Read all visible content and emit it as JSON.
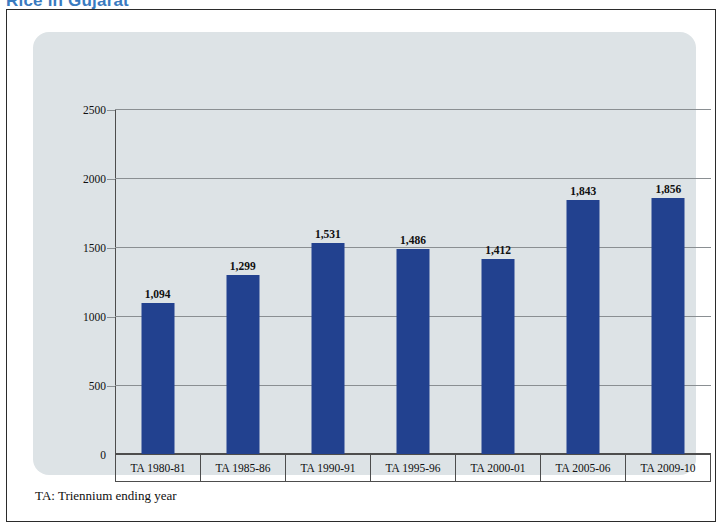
{
  "figure": {
    "title": "Rice in Gujarat",
    "title_color": "#3a7bbf",
    "footnote": "TA: Triennium ending year",
    "panel_color": "#dde3e6",
    "frame_color": "#2b2b2b"
  },
  "chart_data": {
    "type": "bar",
    "title": "Rice in Gujarat",
    "xlabel": "",
    "ylabel": "Average triennium productivity in kg/ha",
    "categories": [
      "TA 1980-81",
      "TA 1985-86",
      "TA 1990-91",
      "TA 1995-96",
      "TA 2000-01",
      "TA 2005-06",
      "TA 2009-10"
    ],
    "values": [
      1094,
      1299,
      1531,
      1486,
      1412,
      1843,
      1856
    ],
    "value_labels": [
      "1,094",
      "1,299",
      "1,531",
      "1,486",
      "1,412",
      "1,843",
      "1,856"
    ],
    "ylim": [
      0,
      2500
    ],
    "yticks": [
      0,
      500,
      1000,
      1500,
      2000,
      2500
    ],
    "ytick_labels": [
      "0",
      "500",
      "1000",
      "1500",
      "2000",
      "2500"
    ],
    "grid": true,
    "legend": null,
    "bar_color": "#22418f",
    "gridline_color": "#8a8f92"
  }
}
